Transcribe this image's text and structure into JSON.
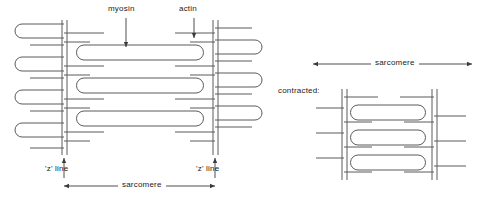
{
  "figure": {
    "stroke_color": "#5a5a5a",
    "text_color": "#1a1a1a",
    "background": "#ffffff"
  },
  "labels": {
    "myosin": "myosin",
    "actin": "actin",
    "z_line_left": "'z' line",
    "z_line_right": "'z' line",
    "sarcomere_relaxed": "sarcomere",
    "sarcomere_contracted": "sarcomere",
    "contracted": "contracted:"
  },
  "relaxed_diagram": {
    "z_lines": [
      {
        "name": "left-z-line",
        "x": 64
      },
      {
        "name": "right-z-line",
        "x": 215
      }
    ],
    "myosin_filaments": [
      {
        "x1": 76,
        "x2": 204,
        "y": 52
      },
      {
        "x1": 76,
        "x2": 204,
        "y": 85
      },
      {
        "x1": 76,
        "x2": 204,
        "y": 117
      }
    ],
    "actin_rows": [
      30,
      48,
      63,
      81,
      96,
      114,
      129,
      147
    ],
    "sarcomere_arrow": {
      "x1": 64,
      "x2": 215,
      "y": 186
    },
    "z_pointer_left": {
      "x": 64,
      "y_from": 178,
      "y_to": 158
    },
    "z_pointer_right": {
      "x": 215,
      "y_from": 178,
      "y_to": 158
    },
    "myosin_pointer": {
      "x": 126,
      "y_from": 18,
      "y_to": 46
    },
    "actin_pointer": {
      "x": 194,
      "y_from": 18,
      "y_to": 37
    }
  },
  "contracted_diagram": {
    "z_lines": [
      {
        "name": "left-z-line",
        "x": 344
      },
      {
        "name": "right-z-line",
        "x": 434
      }
    ],
    "myosin_filaments": [
      {
        "x1": 352,
        "x2": 428,
        "y": 112
      },
      {
        "x1": 352,
        "x2": 428,
        "y": 137
      },
      {
        "x1": 352,
        "x2": 428,
        "y": 162
      }
    ],
    "actin_rows": [
      97,
      112,
      125,
      137,
      150,
      162,
      174
    ],
    "sarcomere_arrow": {
      "x1": 313,
      "x2": 472,
      "y": 64
    }
  }
}
